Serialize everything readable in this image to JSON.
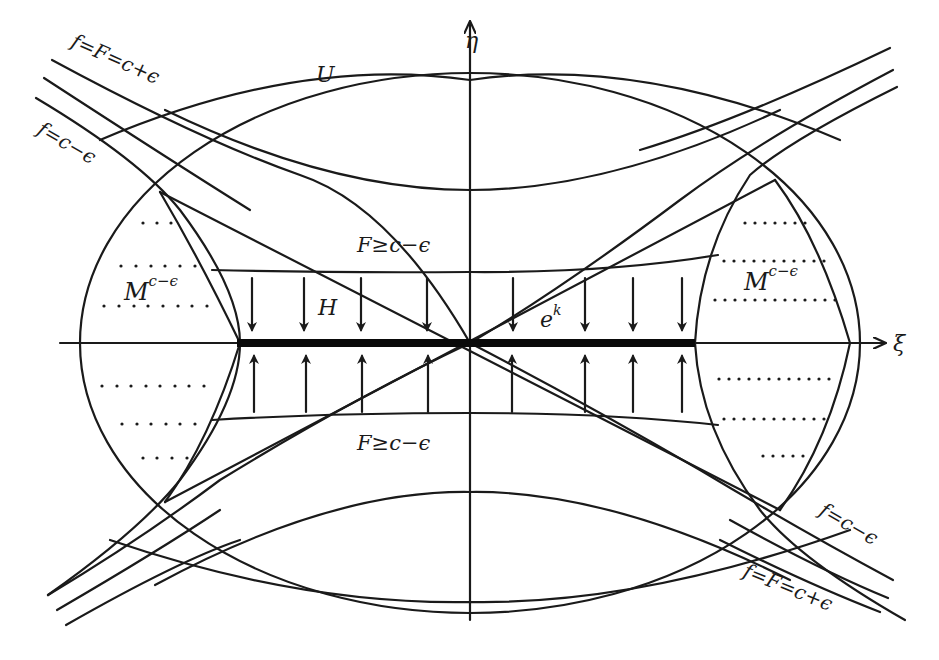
{
  "diagram": {
    "axes": {
      "horizontal_label": "ξ",
      "vertical_label": "η"
    },
    "region_labels": {
      "U": "U",
      "H": "H",
      "e_base": "e",
      "e_sup": "k",
      "F_upper": "F≥c−ϵ",
      "F_lower": "F≥c−ϵ",
      "M_left_base": "M",
      "M_left_sup": "c−ϵ",
      "M_right_base": "M",
      "M_right_sup": "c−ϵ"
    },
    "curve_labels": {
      "top_left_outer": "f=F=c+ϵ",
      "top_left_inner": "f=c−ϵ",
      "bottom_right_inner": "f=c−ϵ",
      "bottom_right_outer": "f=F=c+ϵ"
    },
    "colors": {
      "ink": "#1a1a1a",
      "background": "#ffffff"
    }
  }
}
